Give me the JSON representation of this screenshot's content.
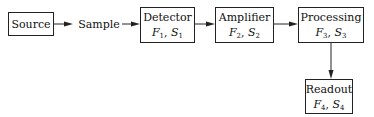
{
  "diagram": {
    "type": "block-diagram",
    "nodes": [
      {
        "id": "source",
        "label": "Source"
      },
      {
        "id": "sample",
        "label": "Sample",
        "boxed": false
      },
      {
        "id": "detector",
        "label": "Detector",
        "F": "F",
        "F_sub": "1",
        "S": "S",
        "S_sub": "1"
      },
      {
        "id": "amplifier",
        "label": "Amplifier",
        "F": "F",
        "F_sub": "2",
        "S": "S",
        "S_sub": "2"
      },
      {
        "id": "processing",
        "label": "Processing",
        "F": "F",
        "F_sub": "3",
        "S": "S",
        "S_sub": "3"
      },
      {
        "id": "readout",
        "label": "Readout",
        "F": "F",
        "F_sub": "4",
        "S": "S",
        "S_sub": "4"
      }
    ],
    "separator": ", ",
    "edges": [
      {
        "from": "source",
        "to": "sample"
      },
      {
        "from": "sample",
        "to": "detector"
      },
      {
        "from": "detector",
        "to": "amplifier"
      },
      {
        "from": "amplifier",
        "to": "processing"
      },
      {
        "from": "processing",
        "to": "readout"
      }
    ],
    "colors": {
      "stroke": "#222222",
      "text": "#111111",
      "background": "#ffffff"
    }
  }
}
